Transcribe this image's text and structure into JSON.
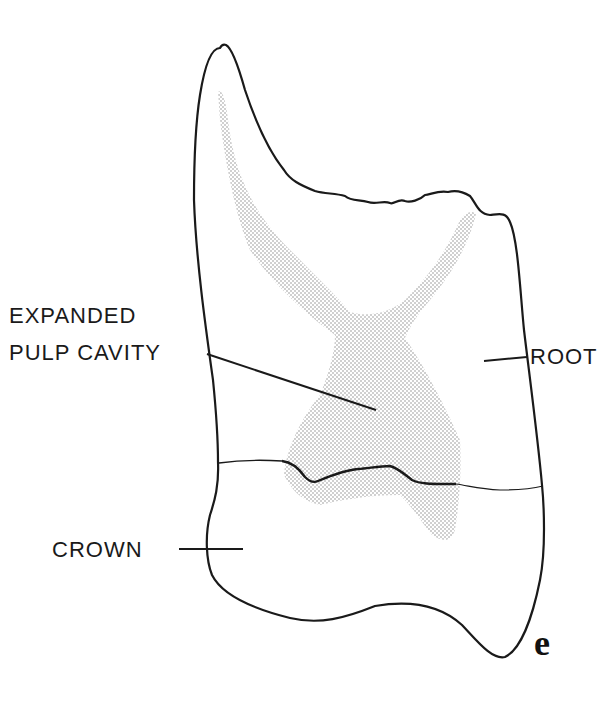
{
  "diagram": {
    "type": "anatomical line drawing (tooth cross-section)",
    "labels": {
      "pulp_line1": "EXPANDED",
      "pulp_line2": "PULP CAVITY",
      "root": "ROOT",
      "crown": "CROWN"
    },
    "figure_letter": "e",
    "colors": {
      "outline": "#1a1a1a",
      "stipple": "#9a9a9a",
      "background": "#ffffff"
    }
  }
}
